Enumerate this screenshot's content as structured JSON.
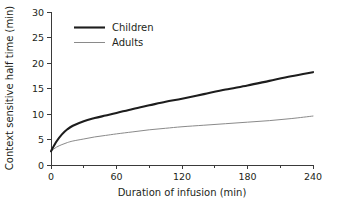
{
  "chart_data": {
    "type": "line",
    "title": "",
    "xlabel": "Duration of infusion (min)",
    "ylabel": "Context sensitive half time (min)",
    "xlim": [
      0,
      240
    ],
    "ylim": [
      0,
      30
    ],
    "xticks": [
      0,
      60,
      120,
      180,
      240
    ],
    "xtick_labels": [
      "0",
      "60",
      "120",
      "180",
      "240"
    ],
    "xminor_ticks": [
      30,
      90,
      150,
      210
    ],
    "yticks": [
      0,
      5,
      10,
      15,
      20,
      25,
      30
    ],
    "ytick_labels": [
      "0",
      "5",
      "10",
      "15",
      "20",
      "25",
      "30"
    ],
    "grid": false,
    "legend_position": "upper left",
    "x": [
      0,
      5,
      10,
      15,
      20,
      30,
      40,
      50,
      60,
      75,
      90,
      105,
      120,
      140,
      160,
      180,
      200,
      220,
      240
    ],
    "series": [
      {
        "name": "Children",
        "color": "#1d1d1d",
        "line_width": 2.1,
        "values": [
          2.7,
          4.6,
          6.0,
          7.0,
          7.7,
          8.6,
          9.2,
          9.7,
          10.2,
          11.0,
          11.7,
          12.4,
          13.0,
          13.9,
          14.8,
          15.6,
          16.5,
          17.4,
          18.2
        ]
      },
      {
        "name": "Adults",
        "color": "#8a8a8a",
        "line_width": 1.0,
        "values": [
          2.7,
          3.5,
          4.0,
          4.4,
          4.7,
          5.1,
          5.5,
          5.8,
          6.1,
          6.5,
          6.9,
          7.2,
          7.5,
          7.8,
          8.1,
          8.4,
          8.7,
          9.1,
          9.6
        ]
      }
    ]
  },
  "legend": {
    "entries": [
      {
        "label": "Children"
      },
      {
        "label": "Adults"
      }
    ]
  },
  "axes": {
    "x_title": "Duration of infusion (min)",
    "y_title": "Context sensitive half time (min)"
  }
}
